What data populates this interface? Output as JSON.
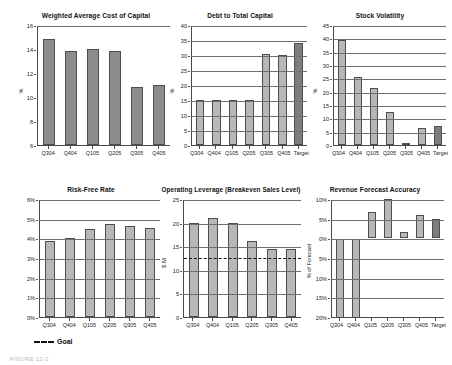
{
  "figure": {
    "caption": "FIGURE 12-2",
    "legend": {
      "label": "Goal",
      "style": "dashed-line"
    }
  },
  "charts": [
    {
      "id": "wacc",
      "title": "Weighted Average Cost of Capital",
      "ylabel": "%",
      "ytick_labels": [
        "16",
        "14",
        "12",
        "10",
        "8",
        "6"
      ],
      "categories": [
        "Q304",
        "Q404",
        "Q105",
        "Q205",
        "Q305",
        "Q405"
      ],
      "values": [
        14.8,
        13.8,
        14.0,
        13.8,
        10.8,
        11.0
      ],
      "bar_style": "dark",
      "has_target": false,
      "grid": false
    },
    {
      "id": "debt-to-total-capital",
      "title": "Debt to Total Capital",
      "ylabel": "%",
      "ytick_labels": [
        "40",
        "35",
        "30",
        "25",
        "20",
        "15",
        "10",
        "5",
        "0"
      ],
      "categories": [
        "Q304",
        "Q404",
        "Q105",
        "Q205",
        "Q305",
        "Q405",
        "Target"
      ],
      "values": [
        15,
        15,
        15,
        15,
        30.5,
        30,
        34
      ],
      "bar_style": "light",
      "has_target": true,
      "grid": true
    },
    {
      "id": "stock-volatility",
      "title": "Stock Volatility",
      "ylabel": "%",
      "ytick_labels": [
        "45",
        "40",
        "35",
        "30",
        "25",
        "20",
        "15",
        "10",
        "5",
        "0"
      ],
      "categories": [
        "Q304",
        "Q404",
        "Q105",
        "Q205",
        "Q305",
        "Q405",
        "Target"
      ],
      "values": [
        39.5,
        25.5,
        21.5,
        12.5,
        0.5,
        6.5,
        7
      ],
      "bar_style": "light",
      "has_target": true,
      "grid": true
    },
    {
      "id": "risk-free-rate",
      "title": "Risk-Free Rate",
      "ylabel": "",
      "ytick_labels": [
        "6%",
        "5%",
        "4%",
        "3%",
        "2%",
        "1%",
        "0%"
      ],
      "categories": [
        "Q304",
        "Q404",
        "Q105",
        "Q205",
        "Q305",
        "Q405"
      ],
      "values": [
        3.85,
        4.0,
        4.45,
        4.75,
        4.65,
        4.55
      ],
      "bar_style": "light",
      "has_target": false,
      "grid": true
    },
    {
      "id": "operating-leverage",
      "title": "Operating Leverage (Breakeven Sales Level)",
      "ylabel": "$ M",
      "ytick_labels": [
        "25",
        "20",
        "15",
        "10",
        "5",
        "0"
      ],
      "categories": [
        "Q304",
        "Q404",
        "Q105",
        "Q205",
        "Q305",
        "Q405"
      ],
      "values": [
        20,
        21,
        20,
        16,
        14.5,
        14.5
      ],
      "goal_value": 12.8,
      "bar_style": "light",
      "has_target": false,
      "grid": true
    },
    {
      "id": "revenue-forecast-accuracy",
      "title": "Revenue Forecast Accuracy",
      "ylabel": "% of Forecast",
      "ytick_labels": [
        "10%",
        "5%",
        "0%",
        "5%",
        "10%",
        "15%",
        "20%"
      ],
      "categories": [
        "Q304",
        "Q404",
        "Q105",
        "Q205",
        "Q305",
        "Q405",
        "Target"
      ],
      "values": [
        -20,
        -20,
        6.8,
        10,
        1.7,
        6,
        5
      ],
      "bar_style": "light",
      "has_target": true,
      "grid": true
    }
  ],
  "chart_data": [
    {
      "type": "bar",
      "title": "Weighted Average Cost of Capital",
      "xlabel": "",
      "ylabel": "%",
      "categories": [
        "Q304",
        "Q404",
        "Q105",
        "Q205",
        "Q305",
        "Q405"
      ],
      "values": [
        14.8,
        13.8,
        14.0,
        13.8,
        10.8,
        11.0
      ],
      "ylim": [
        6,
        16
      ],
      "ytick_values": [
        6,
        8,
        10,
        12,
        14,
        16
      ],
      "grid": false,
      "legend": "none"
    },
    {
      "type": "bar",
      "title": "Debt to Total Capital",
      "xlabel": "",
      "ylabel": "%",
      "categories": [
        "Q304",
        "Q404",
        "Q105",
        "Q205",
        "Q305",
        "Q405",
        "Target"
      ],
      "values": [
        15,
        15,
        15,
        15,
        30.5,
        30,
        34
      ],
      "ylim": [
        0,
        40
      ],
      "ytick_values": [
        0,
        5,
        10,
        15,
        20,
        25,
        30,
        35,
        40
      ],
      "grid": true,
      "legend": "none",
      "annotations": [
        "Target bar shaded darker"
      ]
    },
    {
      "type": "bar",
      "title": "Stock Volatility",
      "xlabel": "",
      "ylabel": "%",
      "categories": [
        "Q304",
        "Q404",
        "Q105",
        "Q205",
        "Q305",
        "Q405",
        "Target"
      ],
      "values": [
        39.5,
        25.5,
        21.5,
        12.5,
        0.5,
        6.5,
        7
      ],
      "ylim": [
        0,
        45
      ],
      "ytick_values": [
        0,
        5,
        10,
        15,
        20,
        25,
        30,
        35,
        40,
        45
      ],
      "grid": true,
      "legend": "none",
      "annotations": [
        "Target bar shaded darker"
      ]
    },
    {
      "type": "bar",
      "title": "Risk-Free Rate",
      "xlabel": "",
      "ylabel": "",
      "categories": [
        "Q304",
        "Q404",
        "Q105",
        "Q205",
        "Q305",
        "Q405"
      ],
      "values": [
        3.85,
        4.0,
        4.45,
        4.75,
        4.65,
        4.55
      ],
      "ylim": [
        0,
        6
      ],
      "ytick_values": [
        0,
        1,
        2,
        3,
        4,
        5,
        6
      ],
      "ytick_labels": [
        "0%",
        "1%",
        "2%",
        "3%",
        "4%",
        "5%",
        "6%"
      ],
      "grid": true,
      "legend": "Goal (dashed)"
    },
    {
      "type": "bar",
      "title": "Operating Leverage (Breakeven Sales Level)",
      "xlabel": "",
      "ylabel": "$ M",
      "categories": [
        "Q304",
        "Q404",
        "Q105",
        "Q205",
        "Q305",
        "Q405"
      ],
      "values": [
        20,
        21,
        20,
        16,
        14.5,
        14.5
      ],
      "ylim": [
        0,
        25
      ],
      "ytick_values": [
        0,
        5,
        10,
        15,
        20,
        25
      ],
      "grid": true,
      "goal_line": 12.8,
      "legend": "Goal (dashed)"
    },
    {
      "type": "bar",
      "title": "Revenue Forecast Accuracy",
      "xlabel": "",
      "ylabel": "% of Forecast",
      "categories": [
        "Q304",
        "Q404",
        "Q105",
        "Q205",
        "Q305",
        "Q405",
        "Target"
      ],
      "values": [
        -20,
        -20,
        6.8,
        10,
        1.7,
        6,
        5
      ],
      "ylim": [
        -20,
        10
      ],
      "ytick_values": [
        -20,
        -15,
        -10,
        -5,
        0,
        5,
        10
      ],
      "ytick_labels": [
        "20%",
        "15%",
        "10%",
        "5%",
        "0%",
        "5%",
        "10%"
      ],
      "grid": true,
      "legend": "none",
      "annotations": [
        "Target bar shaded darker",
        "Q304 and Q404 bars extend to chart bottom"
      ]
    }
  ]
}
